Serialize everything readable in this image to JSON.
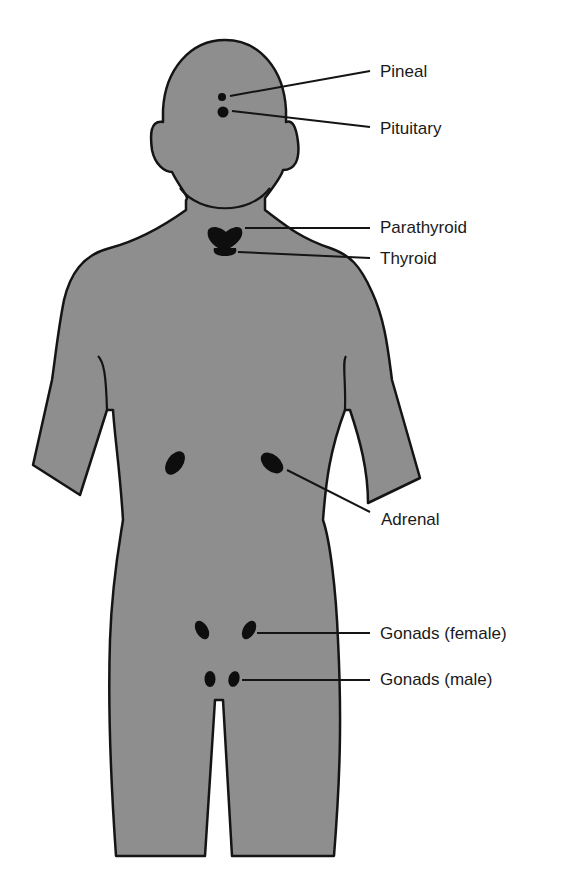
{
  "diagram": {
    "type": "anatomical-illustration",
    "colors": {
      "body_fill": "#8e8e8e",
      "outline": "#141414",
      "gland_fill": "#0e0e0e",
      "background": "#ffffff",
      "label_text": "#1a1a1a"
    },
    "labels": [
      {
        "id": "pineal",
        "text": "Pineal"
      },
      {
        "id": "pituitary",
        "text": "Pituitary"
      },
      {
        "id": "parathyroid",
        "text": "Parathyroid"
      },
      {
        "id": "thyroid",
        "text": "Thyroid"
      },
      {
        "id": "adrenal",
        "text": "Adrenal"
      },
      {
        "id": "gonads-female",
        "text": "Gonads (female)"
      },
      {
        "id": "gonads-male",
        "text": "Gonads (male)"
      }
    ]
  }
}
